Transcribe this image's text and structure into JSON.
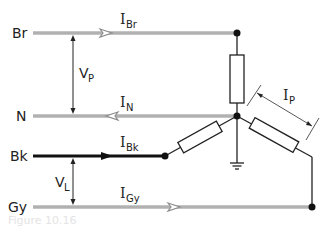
{
  "diagram": {
    "type": "three-phase star (wye) connected load with neutral and earth",
    "colors": {
      "phase_wire": "#8c8c8c",
      "phase_wire_core": "#d6d6d6",
      "black_wire": "#111111",
      "component": "#222222",
      "caption": "#e4e4e4"
    },
    "lines": [
      {
        "id": "br",
        "label": "Br",
        "current_main": "I",
        "current_sub": "Br",
        "direction": "right"
      },
      {
        "id": "n",
        "label": "N",
        "current_main": "I",
        "current_sub": "N",
        "direction": "left"
      },
      {
        "id": "bk",
        "label": "Bk",
        "current_main": "I",
        "current_sub": "Bk",
        "direction": "right"
      },
      {
        "id": "gy",
        "label": "Gy",
        "current_main": "I",
        "current_sub": "Gy",
        "direction": "right"
      }
    ],
    "voltages": [
      {
        "id": "vp",
        "main": "V",
        "sub": "P",
        "between": [
          "Br",
          "N"
        ]
      },
      {
        "id": "vl",
        "main": "V",
        "sub": "L",
        "between": [
          "Bk",
          "Gy"
        ]
      }
    ],
    "phase_current": {
      "main": "I",
      "sub": "P"
    },
    "components": {
      "resistors": 3,
      "ground_symbol": "earth",
      "star_point": "N"
    },
    "caption": "Figure 10.16"
  }
}
